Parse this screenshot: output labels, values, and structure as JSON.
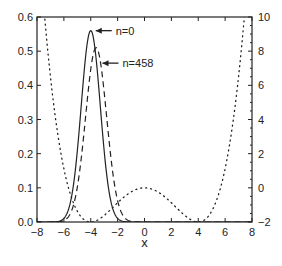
{
  "chart_data": {
    "type": "line",
    "title": "",
    "xlabel": "x",
    "ylabel_left": "",
    "ylabel_right": "",
    "xlim": [
      -8,
      8
    ],
    "ylim_left": [
      0.0,
      0.6
    ],
    "ylim_right": [
      -2,
      10
    ],
    "grid": false,
    "x_ticks": [
      "-8",
      "-6",
      "-4",
      "-2",
      "0",
      "2",
      "4",
      "6",
      "8"
    ],
    "y_left_ticks": [
      "0.0",
      "0.1",
      "0.2",
      "0.3",
      "0.4",
      "0.5",
      "0.6"
    ],
    "y_right_ticks": [
      "-2",
      "0",
      "2",
      "4",
      "6",
      "8",
      "10"
    ],
    "series": [
      {
        "name": "n=0",
        "style": "solid",
        "axis": "left",
        "shape": "gaussian",
        "center": -4.0,
        "peak": 0.56,
        "sigma": 0.71
      },
      {
        "name": "n=458",
        "style": "dashed",
        "axis": "left",
        "shape": "gaussian",
        "center": -3.6,
        "peak": 0.51,
        "sigma": 0.78
      },
      {
        "name": "potential",
        "style": "dotted",
        "axis": "right",
        "shape": "double-well",
        "formula": "(x^2-16)^2/128 - 2",
        "minima": [
          [
            -4,
            -2
          ],
          [
            4,
            -2
          ]
        ],
        "local_max": [
          0,
          0
        ]
      }
    ],
    "annotations": [
      {
        "text": "n=0",
        "arrow_to": [
          -4.0,
          0.56
        ]
      },
      {
        "text": "n=458",
        "arrow_to": [
          -3.5,
          0.465
        ]
      }
    ]
  }
}
